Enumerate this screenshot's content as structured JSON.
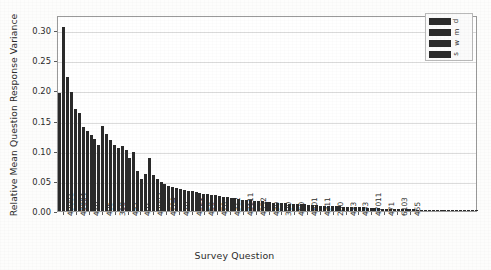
{
  "chart_data": {
    "type": "bar",
    "title": "",
    "xlabel": "Survey Question",
    "ylabel": "Relative Mean Question Response Variance",
    "ylim": [
      0.0,
      0.325
    ],
    "yticks": [
      0.0,
      0.05,
      0.1,
      0.15,
      0.2,
      0.25,
      0.3
    ],
    "ytick_labels": [
      "0.00",
      "0.05",
      "0.10",
      "0.15",
      "0.20",
      "0.25",
      "0.30"
    ],
    "grid": true,
    "legend_position": "upper right",
    "legend": [
      "d",
      "m",
      "w",
      "s"
    ],
    "bar_color": "#2a2a2a",
    "categories": [
      "49001",
      "49004",
      "410",
      "405",
      "310",
      "452",
      "401",
      "49002",
      "4704",
      "420",
      "4321",
      "450",
      "470",
      "4312",
      "43111",
      "4352",
      "430",
      "300",
      "460",
      "4801",
      "4311",
      "200",
      "433",
      "453",
      "47011",
      "471",
      "6103",
      "455"
    ],
    "xtick_labels": [
      "49001",
      "49004",
      "410",
      "405",
      "310",
      "452",
      "401",
      "49002",
      "4704",
      "420",
      "4321",
      "450",
      "470",
      "4312",
      "43111",
      "4352",
      "430",
      "300",
      "460",
      "4801",
      "4311",
      "200",
      "433",
      "453",
      "47011",
      "471",
      "6103",
      "455"
    ],
    "values": [
      0.195,
      0.305,
      0.223,
      0.198,
      0.169,
      0.162,
      0.14,
      0.133,
      0.126,
      0.12,
      0.11,
      0.141,
      0.127,
      0.118,
      0.11,
      0.105,
      0.108,
      0.101,
      0.088,
      0.098,
      0.067,
      0.053,
      0.062,
      0.088,
      0.06,
      0.053,
      0.048,
      0.044
    ],
    "values_full": [
      0.195,
      0.305,
      0.223,
      0.198,
      0.169,
      0.162,
      0.14,
      0.133,
      0.126,
      0.12,
      0.11,
      0.141,
      0.127,
      0.118,
      0.11,
      0.105,
      0.108,
      0.101,
      0.088,
      0.098,
      0.067,
      0.053,
      0.062,
      0.088,
      0.06,
      0.053,
      0.048,
      0.044,
      0.042,
      0.04,
      0.038,
      0.036,
      0.035,
      0.034,
      0.033,
      0.031,
      0.03,
      0.029,
      0.028,
      0.027,
      0.026,
      0.025,
      0.024,
      0.023,
      0.022,
      0.021,
      0.02,
      0.019,
      0.019,
      0.018,
      0.017,
      0.017,
      0.016,
      0.015,
      0.015,
      0.014,
      0.014,
      0.013,
      0.013,
      0.012,
      0.012,
      0.011,
      0.011,
      0.011,
      0.01,
      0.01,
      0.01,
      0.009,
      0.009,
      0.009,
      0.008,
      0.008,
      0.008,
      0.007,
      0.007,
      0.007,
      0.006,
      0.006,
      0.006,
      0.005,
      0.005,
      0.005,
      0.005,
      0.004,
      0.004,
      0.004,
      0.004,
      0.003,
      0.003,
      0.003,
      0.003,
      0.003,
      0.002,
      0.002,
      0.002,
      0.002,
      0.002,
      0.002,
      0.001,
      0.001,
      0.001,
      0.001,
      0.001,
      0.001,
      0.001,
      0.001,
      0.001,
      0.001
    ],
    "n_bars": 110
  }
}
